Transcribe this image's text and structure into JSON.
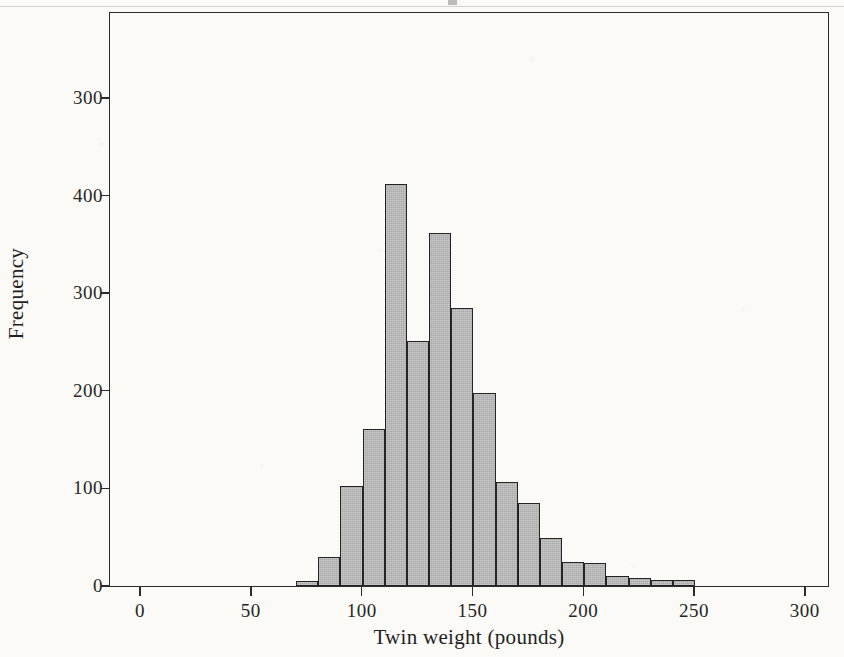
{
  "figure": {
    "background_color": "#fbfaf7",
    "frame_color": "#2b2b2b",
    "bar_fill_color": "#a9a9a9",
    "bar_edge_color": "#242424"
  },
  "chart_data": {
    "type": "bar",
    "title": "",
    "subtitle": "",
    "xlabel": "Twin weight (pounds)",
    "ylabel": "Frequency",
    "xlim": [
      -14,
      310
    ],
    "ylim": [
      0,
      587
    ],
    "grid": false,
    "legend": null,
    "xticks": [
      0,
      50,
      100,
      150,
      200,
      250,
      300
    ],
    "xtick_labels": [
      "0",
      "50",
      "100",
      "150",
      "200",
      "250",
      "300"
    ],
    "yticks": [
      0,
      100,
      200,
      300,
      400,
      500
    ],
    "ytick_labels": [
      "0",
      "100",
      "200",
      "300",
      "400",
      "300"
    ],
    "bin_width": 10,
    "bin_edges": [
      70,
      80,
      90,
      100,
      110,
      120,
      130,
      140,
      150,
      160,
      170,
      180,
      190,
      200,
      210,
      220,
      230,
      240,
      250
    ],
    "categories": [
      "70-80",
      "80-90",
      "90-100",
      "100-110",
      "110-120",
      "120-130",
      "130-140",
      "140-150",
      "150-160",
      "160-170",
      "170-180",
      "180-190",
      "190-200",
      "200-210",
      "210-220",
      "220-230",
      "230-240",
      "240-250"
    ],
    "values": [
      5,
      30,
      102,
      161,
      412,
      251,
      362,
      285,
      198,
      107,
      85,
      49,
      25,
      24,
      10,
      8,
      6,
      6
    ]
  }
}
